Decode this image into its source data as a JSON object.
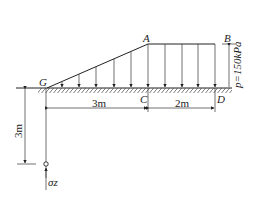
{
  "diagram": {
    "title": "",
    "points": {
      "G": "G",
      "A": "A",
      "B": "B",
      "C": "C",
      "D": "D"
    },
    "load": {
      "label": "p=150kPa",
      "type": "trapezoidal distributed load (triangular ramp G→A, uniform A→B)"
    },
    "dimensions": {
      "horizontal_left": "3m",
      "horizontal_right": "2m",
      "vertical_depth": "3m"
    },
    "stress_point": {
      "label": "σz"
    },
    "colors": {
      "line": "#222222",
      "background": "#ffffff"
    }
  }
}
